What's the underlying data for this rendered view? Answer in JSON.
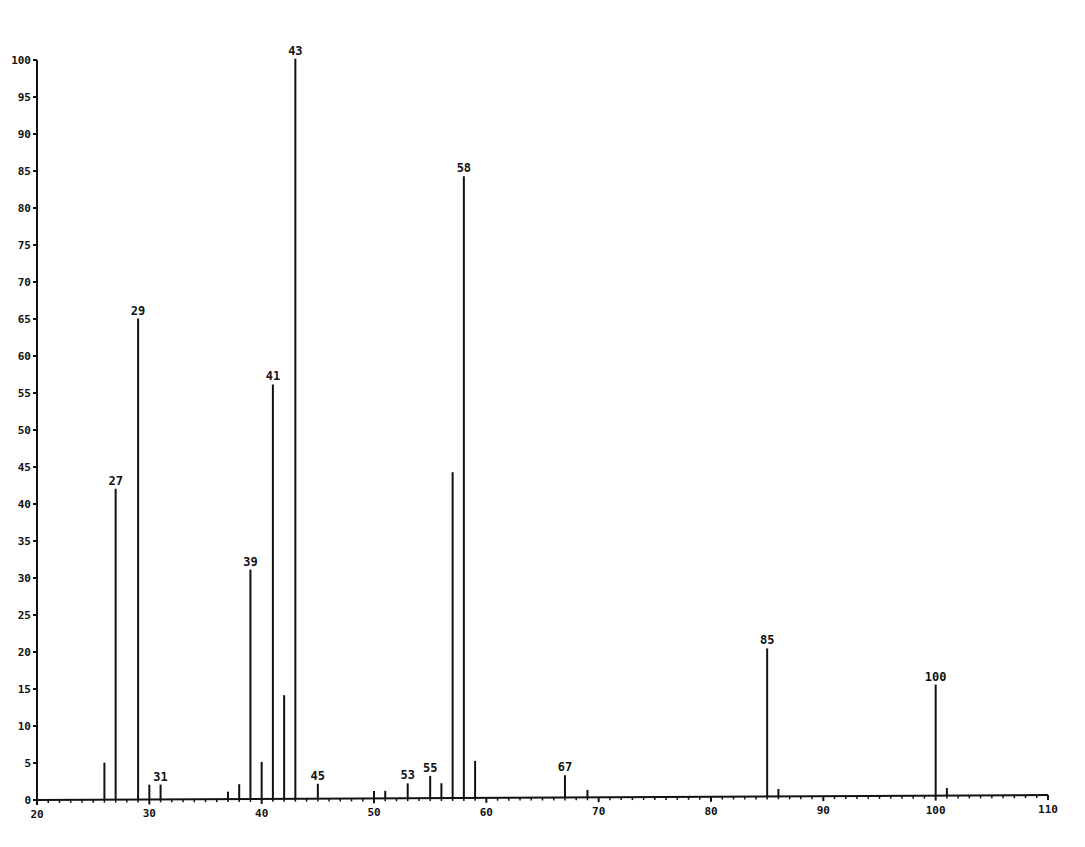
{
  "chart_data": {
    "type": "bar",
    "title": "",
    "xlabel": "",
    "ylabel": "",
    "xlim": [
      20,
      110
    ],
    "ylim": [
      0,
      100
    ],
    "grid": false,
    "x_ticks": [
      20,
      30,
      40,
      50,
      60,
      70,
      80,
      90,
      100,
      110
    ],
    "y_ticks": [
      0,
      5,
      10,
      15,
      20,
      25,
      30,
      35,
      40,
      45,
      50,
      55,
      60,
      65,
      70,
      75,
      80,
      85,
      90,
      95,
      100
    ],
    "series": [
      {
        "name": "mass spectrum",
        "color": "#111111",
        "peaks": [
          {
            "mz": 26,
            "intensity": 5,
            "label": ""
          },
          {
            "mz": 27,
            "intensity": 42,
            "label": "27"
          },
          {
            "mz": 29,
            "intensity": 65,
            "label": "29"
          },
          {
            "mz": 30,
            "intensity": 2,
            "label": ""
          },
          {
            "mz": 31,
            "intensity": 2,
            "label": "31"
          },
          {
            "mz": 37,
            "intensity": 1,
            "label": ""
          },
          {
            "mz": 38,
            "intensity": 2,
            "label": ""
          },
          {
            "mz": 39,
            "intensity": 31,
            "label": "39"
          },
          {
            "mz": 40,
            "intensity": 5,
            "label": ""
          },
          {
            "mz": 41,
            "intensity": 56,
            "label": "41"
          },
          {
            "mz": 42,
            "intensity": 14,
            "label": ""
          },
          {
            "mz": 43,
            "intensity": 100,
            "label": "43"
          },
          {
            "mz": 45,
            "intensity": 2,
            "label": "45"
          },
          {
            "mz": 50,
            "intensity": 1,
            "label": ""
          },
          {
            "mz": 51,
            "intensity": 1,
            "label": ""
          },
          {
            "mz": 53,
            "intensity": 2,
            "label": "53"
          },
          {
            "mz": 55,
            "intensity": 3,
            "label": "55"
          },
          {
            "mz": 56,
            "intensity": 2,
            "label": ""
          },
          {
            "mz": 57,
            "intensity": 44,
            "label": ""
          },
          {
            "mz": 58,
            "intensity": 84,
            "label": "58"
          },
          {
            "mz": 59,
            "intensity": 5,
            "label": ""
          },
          {
            "mz": 67,
            "intensity": 3,
            "label": "67"
          },
          {
            "mz": 69,
            "intensity": 1,
            "label": ""
          },
          {
            "mz": 85,
            "intensity": 20,
            "label": "85"
          },
          {
            "mz": 86,
            "intensity": 1,
            "label": ""
          },
          {
            "mz": 100,
            "intensity": 15,
            "label": "100"
          },
          {
            "mz": 101,
            "intensity": 1,
            "label": ""
          }
        ]
      }
    ]
  },
  "colors": {
    "ink": "#111111",
    "background": "#ffffff"
  }
}
